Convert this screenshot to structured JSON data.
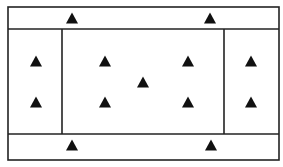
{
  "diagram": {
    "title": "",
    "marker_symbol": "filled-triangle",
    "marker_color": "#111111",
    "line_color": "#222222",
    "zones": [
      {
        "id": "top-band",
        "label": "",
        "marker_count": 2
      },
      {
        "id": "left-panel",
        "label": "",
        "marker_count": 2
      },
      {
        "id": "center-panel",
        "label": "",
        "marker_count": 5
      },
      {
        "id": "right-panel",
        "label": "",
        "marker_count": 2
      },
      {
        "id": "bottom-band",
        "label": "",
        "marker_count": 2
      }
    ],
    "total_markers": 13
  }
}
